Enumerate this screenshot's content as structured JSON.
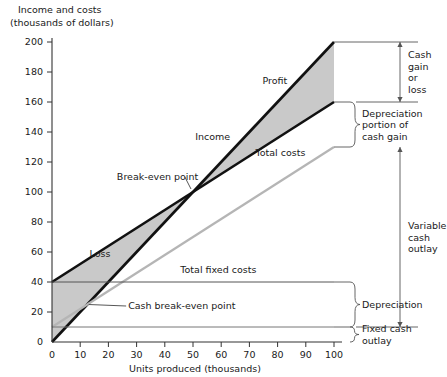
{
  "chart_data": {
    "type": "line",
    "title": "",
    "ylabel": "Income and costs (thousands of dollars)",
    "ylabel_line1": "Income and costs",
    "ylabel_line2": "(thousands of dollars)",
    "xlabel": "Units produced (thousands)",
    "xlim": [
      0,
      100
    ],
    "ylim": [
      0,
      200
    ],
    "xticks": [
      0,
      10,
      20,
      30,
      40,
      50,
      60,
      70,
      80,
      90,
      100
    ],
    "yticks": [
      0,
      20,
      40,
      60,
      80,
      100,
      120,
      140,
      160,
      180,
      200
    ],
    "grid": false,
    "legend": "none",
    "series": [
      {
        "name": "Income",
        "label": "Income",
        "color": "#111111",
        "width": 2.6,
        "points": [
          [
            0,
            0
          ],
          [
            100,
            200
          ]
        ]
      },
      {
        "name": "Total costs",
        "label": "Total costs",
        "color": "#111111",
        "width": 2.6,
        "points": [
          [
            0,
            40
          ],
          [
            100,
            160
          ]
        ]
      },
      {
        "name": "Cash outlay",
        "label": "",
        "color": "#b5b5b5",
        "width": 2.2,
        "points": [
          [
            0,
            10
          ],
          [
            100,
            130
          ]
        ]
      },
      {
        "name": "Total fixed costs",
        "label": "Total fixed costs",
        "color": "#555555",
        "width": 1.0,
        "points": [
          [
            0,
            40
          ],
          [
            100,
            40
          ]
        ]
      },
      {
        "name": "Fixed cash outlay line",
        "label": "",
        "color": "#777777",
        "width": 1.0,
        "points": [
          [
            0,
            10
          ],
          [
            100,
            10
          ]
        ]
      }
    ],
    "regions": [
      {
        "name": "Loss",
        "label": "Loss",
        "fill": "#c9c9c9",
        "label_x": 17,
        "label_y": 57
      },
      {
        "name": "Profit",
        "label": "Profit",
        "fill": "#c9c9c9",
        "label_x": 79,
        "label_y": 172
      }
    ],
    "annotations": [
      {
        "name": "income-label",
        "text": "Income",
        "x": 57,
        "y": 135
      },
      {
        "name": "profit-label",
        "text": "Profit",
        "x": 79,
        "y": 172
      },
      {
        "name": "total-costs-label",
        "text": "Total costs",
        "x": 81,
        "y": 124
      },
      {
        "name": "loss-label",
        "text": "Loss",
        "x": 17,
        "y": 57
      },
      {
        "name": "break-even-point",
        "text": "Break-even point",
        "x": 23,
        "y": 108
      },
      {
        "name": "cash-break-even-point",
        "text": "Cash break-even point",
        "x": 27,
        "y": 22
      },
      {
        "name": "total-fixed-costs-label",
        "text": "Total fixed costs",
        "x": 59,
        "y": 46
      }
    ],
    "break_even": {
      "label": "Break-even point",
      "x": 50,
      "y": 100
    },
    "cash_break_even": {
      "label": "Cash break-even point",
      "x": 13,
      "y": 25
    },
    "brackets": [
      {
        "name": "cash-gain-or-loss",
        "lines": [
          "Cash",
          "gain",
          "or",
          "loss"
        ],
        "from": 200,
        "to": 160
      },
      {
        "name": "depreciation-portion-of-cash-gain",
        "lines": [
          "Depreciation",
          "portion of",
          "cash gain"
        ],
        "from": 160,
        "to": 130
      },
      {
        "name": "variable-cash-outlay",
        "lines": [
          "Variable",
          "cash",
          "outlay"
        ],
        "from": 130,
        "to": 10
      },
      {
        "name": "depreciation",
        "lines": [
          "Depreciation"
        ],
        "from": 40,
        "to": 10
      },
      {
        "name": "fixed-cash-outlay",
        "lines": [
          "Fixed cash",
          "outlay"
        ],
        "from": 10,
        "to": 0
      }
    ]
  },
  "colors": {
    "axis": "#333333",
    "line_dark": "#111111",
    "line_gray": "#b5b5b5",
    "fill_gray": "#c9c9c9",
    "annotation": "#1a1a1a",
    "background": "#ffffff"
  }
}
